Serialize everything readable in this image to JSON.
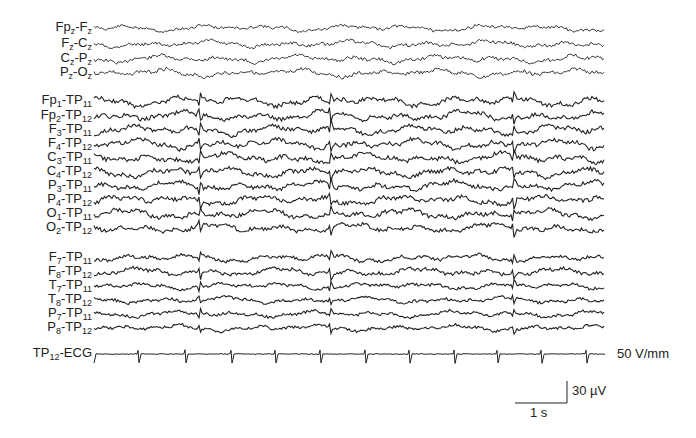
{
  "figure": {
    "type": "EEG recording",
    "trace_x_start": 94,
    "trace_x_end": 605,
    "trace_color": "#222222",
    "groups": [
      {
        "name": "midline-bipolar",
        "channels": [
          {
            "label": "Fp",
            "sub": "z",
            "label2": "-F",
            "sub2": "z",
            "y": 28,
            "amp": 3.2,
            "seed": 11
          },
          {
            "label": "F",
            "sub": "z",
            "label2": "-C",
            "sub2": "z",
            "y": 44,
            "amp": 3.4,
            "seed": 12
          },
          {
            "label": "C",
            "sub": "z",
            "label2": "-P",
            "sub2": "z",
            "y": 59,
            "amp": 3.6,
            "seed": 13
          },
          {
            "label": "P",
            "sub": "z",
            "label2": "-O",
            "sub2": "z",
            "y": 73,
            "amp": 3.8,
            "seed": 14
          }
        ]
      },
      {
        "name": "parasagittal-referential",
        "channels": [
          {
            "label": "Fp",
            "sub": "1",
            "label2": "-TP",
            "sub2": "11",
            "y": 101,
            "amp": 4.5,
            "seed": 21
          },
          {
            "label": "Fp",
            "sub": "2",
            "label2": "-TP",
            "sub2": "12",
            "y": 116,
            "amp": 4.5,
            "seed": 22
          },
          {
            "label": "F",
            "sub": "3",
            "label2": "-TP",
            "sub2": "11",
            "y": 130,
            "amp": 4.6,
            "seed": 23
          },
          {
            "label": "F",
            "sub": "4",
            "label2": "-TP",
            "sub2": "12",
            "y": 144,
            "amp": 4.6,
            "seed": 24
          },
          {
            "label": "C",
            "sub": "3",
            "label2": "-TP",
            "sub2": "11",
            "y": 158,
            "amp": 4.6,
            "seed": 25
          },
          {
            "label": "C",
            "sub": "4",
            "label2": "-TP",
            "sub2": "12",
            "y": 172,
            "amp": 4.5,
            "seed": 26
          },
          {
            "label": "P",
            "sub": "3",
            "label2": "-TP",
            "sub2": "11",
            "y": 186,
            "amp": 4.4,
            "seed": 27
          },
          {
            "label": "P",
            "sub": "4",
            "label2": "-TP",
            "sub2": "12",
            "y": 200,
            "amp": 4.4,
            "seed": 28
          },
          {
            "label": "O",
            "sub": "1",
            "label2": "-TP",
            "sub2": "11",
            "y": 214,
            "amp": 4.4,
            "seed": 29
          },
          {
            "label": "O",
            "sub": "2",
            "label2": "-TP",
            "sub2": "12",
            "y": 228,
            "amp": 4.2,
            "seed": 30
          }
        ]
      },
      {
        "name": "temporal-referential",
        "channels": [
          {
            "label": "F",
            "sub": "7",
            "label2": "-TP",
            "sub2": "11",
            "y": 258,
            "amp": 3.8,
            "seed": 41
          },
          {
            "label": "F",
            "sub": "8",
            "label2": "-TP",
            "sub2": "12",
            "y": 272,
            "amp": 3.8,
            "seed": 42
          },
          {
            "label": "T",
            "sub": "7",
            "label2": "-TP",
            "sub2": "11",
            "y": 286,
            "amp": 3.0,
            "seed": 43
          },
          {
            "label": "T",
            "sub": "8",
            "label2": "-TP",
            "sub2": "12",
            "y": 300,
            "amp": 3.0,
            "seed": 44
          },
          {
            "label": "P",
            "sub": "7",
            "label2": "-TP",
            "sub2": "11",
            "y": 314,
            "amp": 3.0,
            "seed": 45
          },
          {
            "label": "P",
            "sub": "8",
            "label2": "-TP",
            "sub2": "12",
            "y": 328,
            "amp": 3.0,
            "seed": 46
          }
        ]
      }
    ],
    "artifact_x": [
      200,
      331,
      514
    ],
    "ecg": {
      "label": "TP",
      "sub": "12",
      "label2": "-ECG",
      "y": 354,
      "beats_x": [
        94,
        139,
        186,
        232,
        276,
        321,
        366,
        410,
        455,
        498,
        542,
        587
      ],
      "gain_label": "50 V/mm"
    },
    "scale_bar": {
      "voltage_label": "30 µV",
      "time_label": "1 s",
      "x_left": 515,
      "x_right": 567,
      "y_top": 381,
      "y_bottom": 403
    }
  }
}
